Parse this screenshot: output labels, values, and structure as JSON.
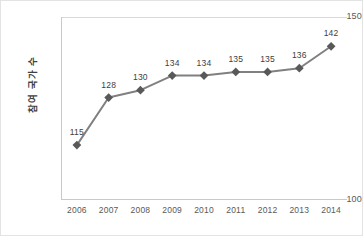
{
  "chart_data": {
    "type": "line",
    "title": "",
    "xlabel": "",
    "ylabel": "참여 국가 수",
    "categories": [
      "2006",
      "2007",
      "2008",
      "2009",
      "2010",
      "2011",
      "2012",
      "2013",
      "2014"
    ],
    "values": [
      115,
      128,
      130,
      134,
      134,
      135,
      135,
      136,
      142
    ],
    "series": [
      {
        "name": "참여 국가 수",
        "values": [
          115,
          128,
          130,
          134,
          134,
          135,
          135,
          136,
          142
        ]
      }
    ],
    "ylim": [
      100,
      150
    ],
    "yticks": [
      100,
      150
    ],
    "ytick_labels": [
      "100",
      "150"
    ],
    "grid": false,
    "legend": false,
    "data_labels": [
      "115",
      "128",
      "130",
      "134",
      "134",
      "135",
      "135",
      "136",
      "142"
    ],
    "marker": "square",
    "line_color": "#808080",
    "marker_color": "#595959",
    "axis_color": "#c9c9c9",
    "text_color": "#595959",
    "label_color": "#404040",
    "background": "#ffffff",
    "border_color": "#e3e3e3"
  }
}
